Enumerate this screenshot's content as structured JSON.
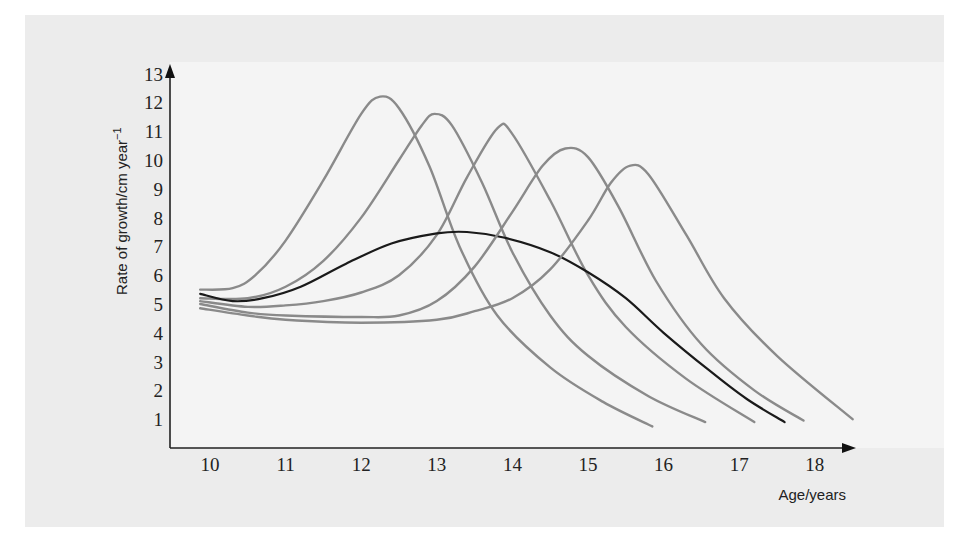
{
  "chart_data": {
    "type": "line",
    "title": "",
    "xlabel": "Age/years",
    "ylabel": "Rate of growth/cm year",
    "ylabel_superscript": "−1",
    "xlim": [
      9.5,
      18.5
    ],
    "ylim": [
      0,
      13
    ],
    "x_ticks": [
      10,
      11,
      12,
      13,
      14,
      15,
      16,
      17,
      18
    ],
    "y_ticks": [
      1,
      2,
      3,
      4,
      5,
      6,
      7,
      8,
      9,
      10,
      11,
      12,
      13
    ],
    "grid": false,
    "legend": null,
    "series": [
      {
        "name": "individual-1",
        "color": "#8a8a8a",
        "points": [
          [
            9.87,
            5.5
          ],
          [
            10.3,
            5.55
          ],
          [
            10.6,
            6.0
          ],
          [
            11.0,
            7.2
          ],
          [
            11.5,
            9.3
          ],
          [
            12.0,
            11.6
          ],
          [
            12.25,
            12.2
          ],
          [
            12.5,
            11.8
          ],
          [
            12.9,
            9.8
          ],
          [
            13.3,
            7.0
          ],
          [
            13.8,
            4.6
          ],
          [
            14.5,
            2.8
          ],
          [
            15.2,
            1.6
          ],
          [
            15.85,
            0.75
          ]
        ]
      },
      {
        "name": "individual-2",
        "color": "#8a8a8a",
        "points": [
          [
            9.87,
            5.2
          ],
          [
            10.5,
            5.2
          ],
          [
            11.0,
            5.6
          ],
          [
            11.5,
            6.5
          ],
          [
            12.0,
            8.0
          ],
          [
            12.5,
            10.0
          ],
          [
            12.8,
            11.2
          ],
          [
            12.97,
            11.6
          ],
          [
            13.2,
            11.2
          ],
          [
            13.6,
            9.2
          ],
          [
            14.0,
            6.8
          ],
          [
            14.5,
            4.6
          ],
          [
            15.0,
            3.2
          ],
          [
            15.8,
            1.8
          ],
          [
            16.55,
            0.9
          ]
        ]
      },
      {
        "name": "individual-3",
        "color": "#8a8a8a",
        "points": [
          [
            9.87,
            5.1
          ],
          [
            10.5,
            4.9
          ],
          [
            11.0,
            4.95
          ],
          [
            11.5,
            5.1
          ],
          [
            12.0,
            5.4
          ],
          [
            12.5,
            6.0
          ],
          [
            13.0,
            7.4
          ],
          [
            13.4,
            9.4
          ],
          [
            13.8,
            11.1
          ],
          [
            14.0,
            10.9
          ],
          [
            14.5,
            8.6
          ],
          [
            15.0,
            6.0
          ],
          [
            15.5,
            4.2
          ],
          [
            16.3,
            2.4
          ],
          [
            17.2,
            0.9
          ]
        ]
      },
      {
        "name": "average",
        "color": "#1a1a1a",
        "points": [
          [
            9.87,
            5.35
          ],
          [
            10.3,
            5.1
          ],
          [
            10.7,
            5.2
          ],
          [
            11.2,
            5.6
          ],
          [
            11.8,
            6.4
          ],
          [
            12.4,
            7.1
          ],
          [
            13.0,
            7.45
          ],
          [
            13.4,
            7.5
          ],
          [
            13.9,
            7.3
          ],
          [
            14.5,
            6.8
          ],
          [
            15.0,
            6.1
          ],
          [
            15.5,
            5.2
          ],
          [
            16.0,
            4.0
          ],
          [
            16.6,
            2.7
          ],
          [
            17.1,
            1.7
          ],
          [
            17.6,
            0.9
          ]
        ]
      },
      {
        "name": "individual-4",
        "color": "#8a8a8a",
        "points": [
          [
            9.87,
            5.0
          ],
          [
            10.5,
            4.7
          ],
          [
            11.0,
            4.6
          ],
          [
            12.0,
            4.55
          ],
          [
            12.5,
            4.6
          ],
          [
            13.0,
            5.1
          ],
          [
            13.5,
            6.3
          ],
          [
            14.0,
            8.2
          ],
          [
            14.4,
            9.8
          ],
          [
            14.7,
            10.4
          ],
          [
            15.0,
            10.1
          ],
          [
            15.4,
            8.4
          ],
          [
            15.9,
            5.8
          ],
          [
            16.5,
            3.6
          ],
          [
            17.2,
            2.0
          ],
          [
            17.85,
            0.95
          ]
        ]
      },
      {
        "name": "individual-5",
        "color": "#8a8a8a",
        "points": [
          [
            9.87,
            4.85
          ],
          [
            10.5,
            4.6
          ],
          [
            11.0,
            4.45
          ],
          [
            12.0,
            4.35
          ],
          [
            13.0,
            4.45
          ],
          [
            13.5,
            4.75
          ],
          [
            14.0,
            5.2
          ],
          [
            14.5,
            6.2
          ],
          [
            15.0,
            7.9
          ],
          [
            15.3,
            9.2
          ],
          [
            15.55,
            9.8
          ],
          [
            15.8,
            9.5
          ],
          [
            16.3,
            7.4
          ],
          [
            16.8,
            5.2
          ],
          [
            17.5,
            3.2
          ],
          [
            18.5,
            1.0
          ]
        ]
      }
    ]
  },
  "labels": {
    "xlabel": "Age/years",
    "ylabel": "Rate of growth/cm year",
    "ylabel_sup": "−1"
  },
  "colors": {
    "panel_bg": "#ececec",
    "axis": "#222222",
    "individual_curve": "#8a8a8a",
    "average_curve": "#1a1a1a"
  }
}
